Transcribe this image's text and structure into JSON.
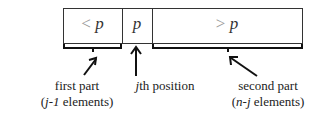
{
  "diagram": {
    "cells": [
      {
        "op": "<",
        "var": "p"
      },
      {
        "op": "",
        "var": "p"
      },
      {
        "op": ">",
        "var": "p"
      }
    ],
    "labels": {
      "first_part": {
        "line1": "first part",
        "line2_italic": "j-1",
        "line2_rest": " elements)"
      },
      "pivot": {
        "italic": "j",
        "rest": "th position"
      },
      "second_part": {
        "line1": "second part",
        "line2_italic": "n-j",
        "line2_rest": " elements)"
      }
    },
    "paren_open": "("
  }
}
